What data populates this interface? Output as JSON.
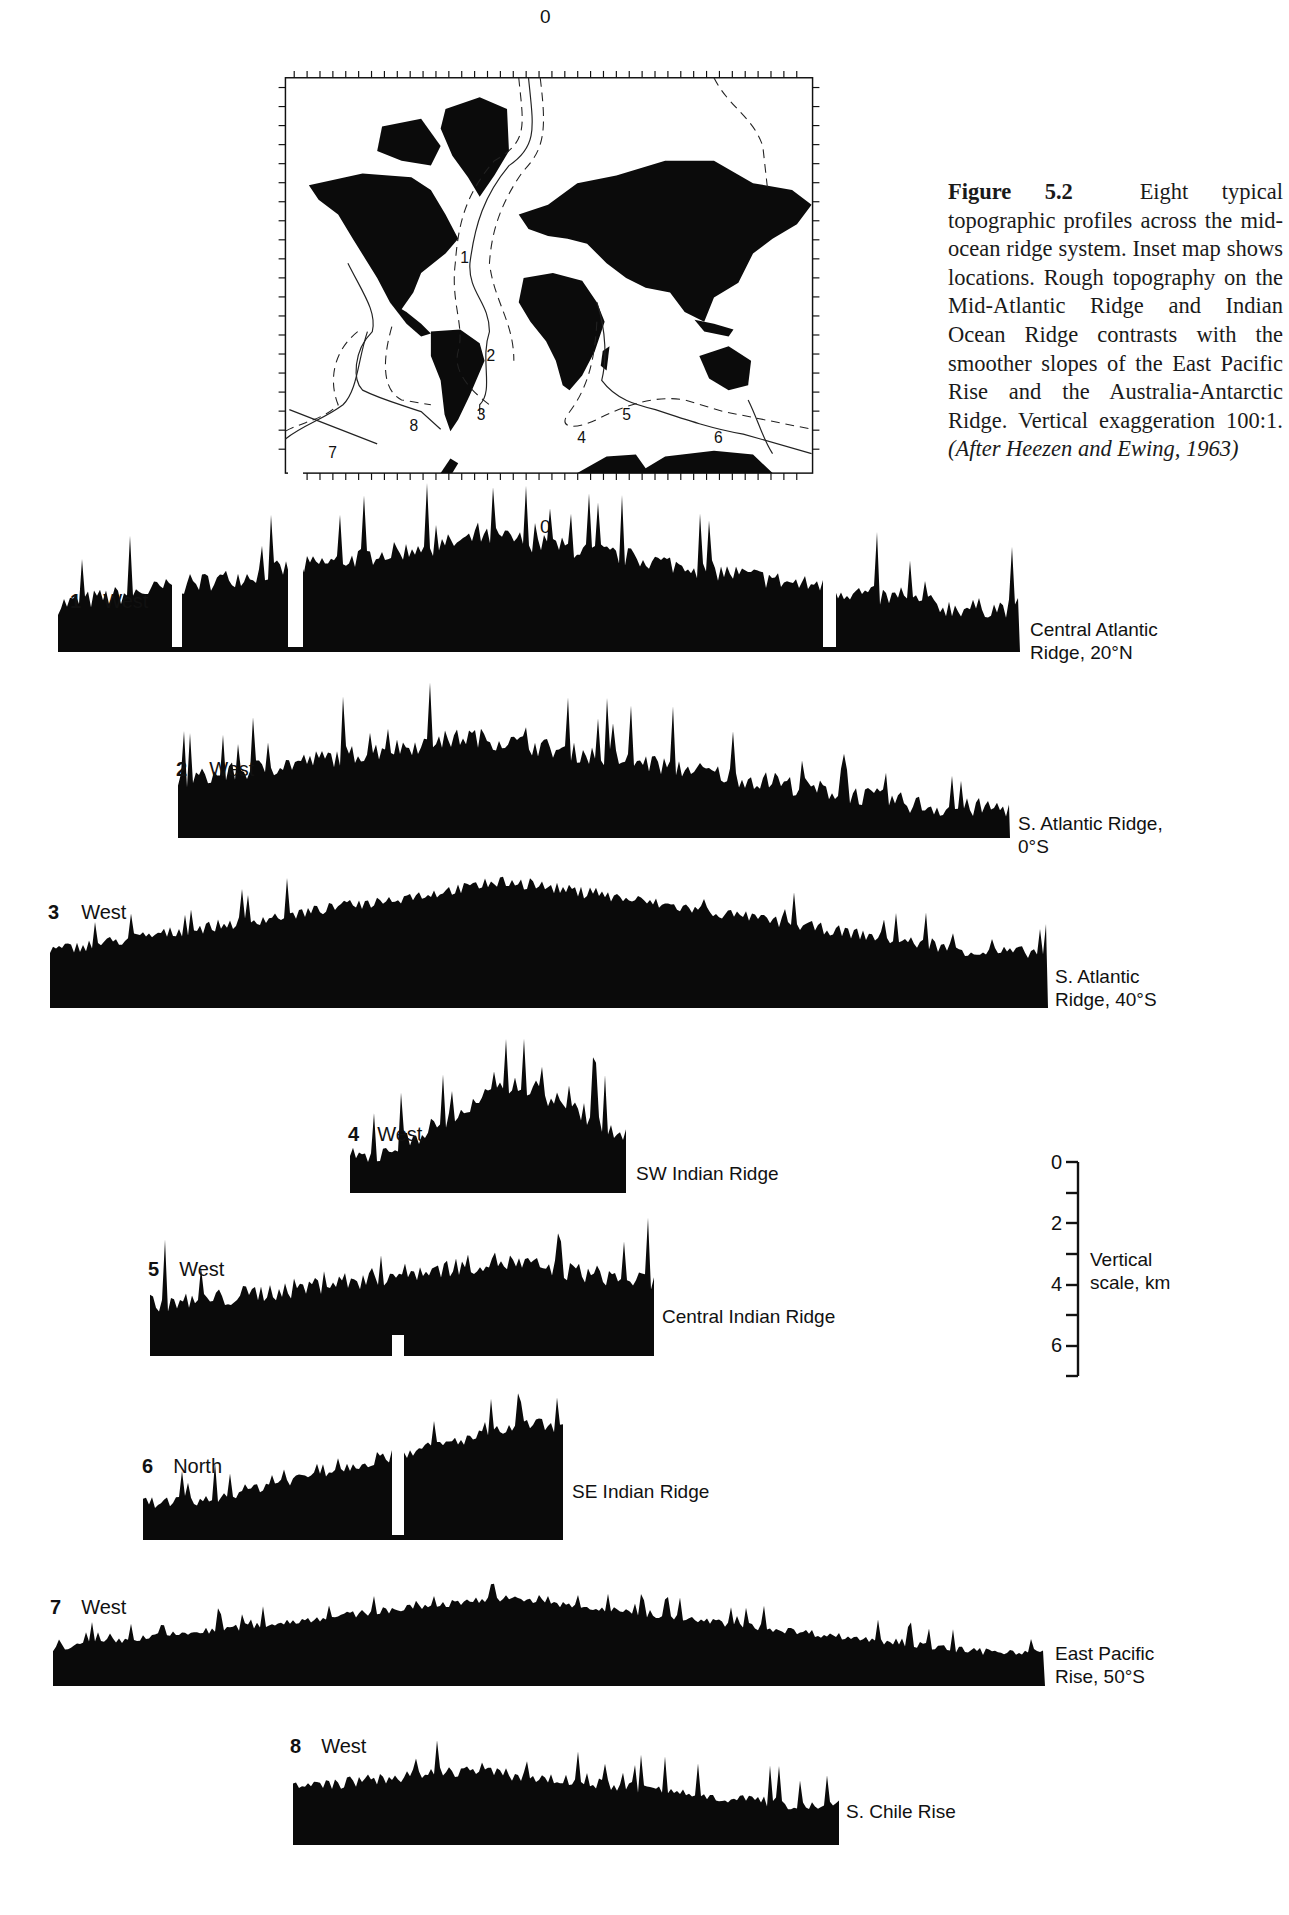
{
  "figure": {
    "caption_label": "Figure 5.2",
    "caption_text": "Eight typical topographic profiles across the mid-ocean ridge system. Inset map shows locations. Rough topography on the Mid-Atlantic Ridge and Indian Ocean Ridge contrasts with the smoother slopes of the East Pacific Rise and the Australia-Antarctic Ridge. Vertical exaggeration 100:1.",
    "caption_source": "(After Heezen and Ewing, 1963)"
  },
  "inset_map": {
    "top_axis_label": "0",
    "bottom_axis_label": "0",
    "location_labels": [
      "1",
      "2",
      "3",
      "4",
      "5",
      "6",
      "7",
      "8"
    ]
  },
  "scale_bar": {
    "title_line1": "Vertical",
    "title_line2": "scale, km",
    "ticks": [
      "0",
      "2",
      "4",
      "6"
    ]
  },
  "profiles": [
    {
      "number": "1",
      "direction": "West",
      "name_line1": "Central Atlantic",
      "name_line2": "Ridge, 20°N"
    },
    {
      "number": "2",
      "direction": "West",
      "name_line1": "S. Atlantic Ridge,",
      "name_line2": "0°S"
    },
    {
      "number": "3",
      "direction": "West",
      "name_line1": "S. Atlantic",
      "name_line2": "Ridge, 40°S"
    },
    {
      "number": "4",
      "direction": "West",
      "name_line1": "SW Indian Ridge",
      "name_line2": ""
    },
    {
      "number": "5",
      "direction": "West",
      "name_line1": "Central Indian Ridge",
      "name_line2": ""
    },
    {
      "number": "6",
      "direction": "North",
      "name_line1": "SE Indian Ridge",
      "name_line2": ""
    },
    {
      "number": "7",
      "direction": "West",
      "name_line1": "East Pacific",
      "name_line2": "Rise, 50°S"
    },
    {
      "number": "8",
      "direction": "West",
      "name_line1": "S. Chile Rise",
      "name_line2": ""
    }
  ],
  "profile_render_params": {
    "_note": "Procedural parameters used to generate stylized silhouettes; these are approximate shape hints, not digitized depth measurements.",
    "1": {
      "x0": 58,
      "x1": 1020,
      "base": 652,
      "floor": 618,
      "peak_x": 495,
      "peak_top": 500,
      "rough": "high",
      "gaps": [
        [
          172,
          182
        ],
        [
          288,
          303
        ],
        [
          823,
          836
        ]
      ]
    },
    "2": {
      "x0": 178,
      "x1": 1010,
      "base": 838,
      "floor": 818,
      "peak_x": 470,
      "peak_top": 700,
      "rough": "high",
      "gaps": []
    },
    "3": {
      "x0": 50,
      "x1": 1048,
      "base": 1008,
      "floor": 958,
      "peak_x": 510,
      "peak_top": 855,
      "rough": "medium",
      "gaps": []
    },
    "4": {
      "x0": 350,
      "x1": 626,
      "base": 1193,
      "floor": 1168,
      "peak_x": 520,
      "peak_top": 1045,
      "rough": "high",
      "gaps": []
    },
    "5": {
      "x0": 150,
      "x1": 654,
      "base": 1356,
      "floor": 1312,
      "peak_x": 495,
      "peak_top": 1230,
      "rough": "high",
      "gaps": []
    },
    "6": {
      "x0": 143,
      "x1": 563,
      "base": 1540,
      "floor": 1508,
      "peak_x": 535,
      "peak_top": 1395,
      "rough": "medium",
      "gaps": [
        [
          392,
          404
        ]
      ]
    },
    "7": {
      "x0": 53,
      "x1": 1045,
      "base": 1686,
      "floor": 1655,
      "peak_x": 500,
      "peak_top": 1580,
      "rough": "low",
      "gaps": []
    },
    "8": {
      "x0": 293,
      "x1": 839,
      "base": 1845,
      "floor": 1810,
      "peak_x": 465,
      "peak_top": 1750,
      "rough": "medium",
      "gaps": []
    }
  }
}
